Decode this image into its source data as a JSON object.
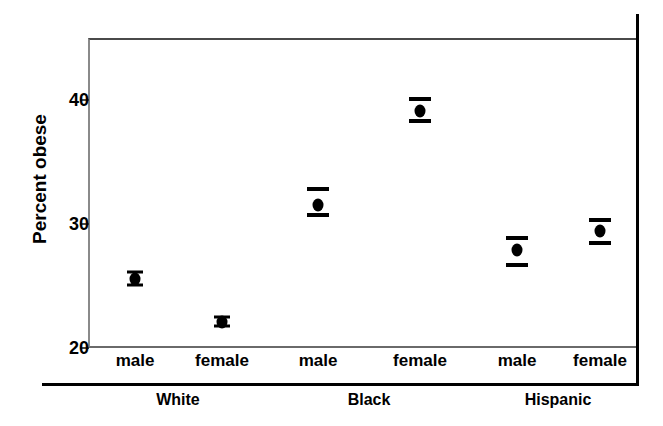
{
  "chart_data": {
    "type": "scatter",
    "title": "",
    "subtitle": "",
    "xlabel": "",
    "ylabel": "Percent obese",
    "ylim": [
      20,
      45.8
    ],
    "yticks": [
      20,
      30,
      40
    ],
    "ytick_labels": [
      "20",
      "30",
      "40"
    ],
    "grid": false,
    "legend": "none",
    "annotations": [],
    "value_label": "Percent obese",
    "error_bar_style": "horizontal-cap 95% confidence interval",
    "group_label_row": [
      "White",
      "Black",
      "Hispanic"
    ],
    "category_label_row": [
      "male",
      "female",
      "male",
      "female",
      "male",
      "female"
    ],
    "categories": [
      "White male",
      "White female",
      "Black male",
      "Black female",
      "Hispanic male",
      "Hispanic female"
    ],
    "values": [
      25.6,
      22.1,
      31.5,
      39.1,
      27.9,
      29.4
    ],
    "ci_lower": [
      25.1,
      21.8,
      30.7,
      38.3,
      26.7,
      28.5
    ],
    "ci_upper": [
      26.1,
      22.5,
      32.8,
      40.1,
      28.9,
      30.3
    ],
    "points": [
      {
        "group": "White",
        "sex": "male",
        "label": "male",
        "value": 25.6,
        "ci_lower": 25.1,
        "ci_upper": 26.1,
        "x_px": 135,
        "cap_width": "narrow"
      },
      {
        "group": "White",
        "sex": "female",
        "label": "female",
        "value": 22.1,
        "ci_lower": 21.8,
        "ci_upper": 22.5,
        "x_px": 222,
        "cap_width": "narrow"
      },
      {
        "group": "Black",
        "sex": "male",
        "label": "male",
        "value": 31.5,
        "ci_lower": 30.7,
        "ci_upper": 32.8,
        "x_px": 318,
        "cap_width": "wide"
      },
      {
        "group": "Black",
        "sex": "female",
        "label": "female",
        "value": 39.1,
        "ci_lower": 38.3,
        "ci_upper": 40.1,
        "x_px": 420,
        "cap_width": "wide"
      },
      {
        "group": "Hispanic",
        "sex": "male",
        "label": "male",
        "value": 27.9,
        "ci_lower": 26.7,
        "ci_upper": 28.9,
        "x_px": 517,
        "cap_width": "wide"
      },
      {
        "group": "Hispanic",
        "sex": "female",
        "label": "female",
        "value": 29.4,
        "ci_lower": 28.5,
        "ci_upper": 30.3,
        "x_px": 600,
        "cap_width": "wide"
      }
    ],
    "groups": [
      {
        "label": "White",
        "x_px": 178
      },
      {
        "label": "Black",
        "x_px": 369
      },
      {
        "label": "Hispanic",
        "x_px": 558
      }
    ],
    "colors": {
      "marker": "#000000",
      "axis": "#000000",
      "frame": "#6a6a6a",
      "background": "#ffffff"
    }
  }
}
